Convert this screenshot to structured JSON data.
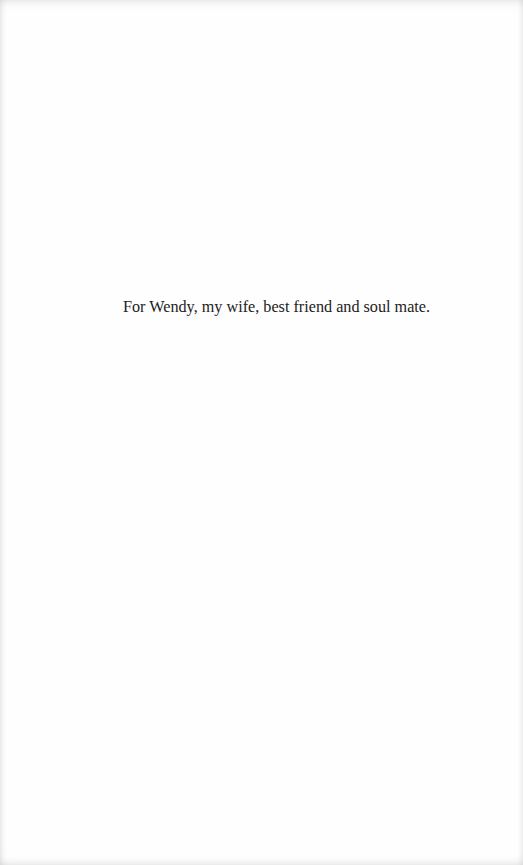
{
  "page": {
    "type": "dedication",
    "dedication_text": "For Wendy, my wife, best friend and soul mate."
  },
  "colors": {
    "background": "#fefefe",
    "text": "#222222"
  }
}
